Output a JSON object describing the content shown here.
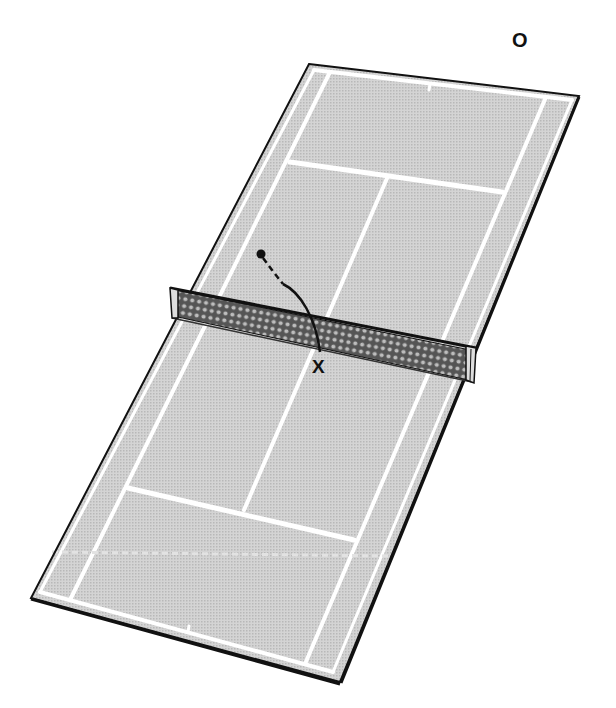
{
  "diagram": {
    "colors": {
      "court_surface": "#cfcfcf",
      "court_lines": "#ffffff",
      "border": "#111111",
      "net_mesh": "#222222",
      "trajectory": "#111111"
    },
    "court": {
      "corners": {
        "far_left": [
          309,
          64
        ],
        "far_right": [
          579,
          96
        ],
        "near_right": [
          340,
          682
        ],
        "near_left": [
          31,
          598
        ]
      }
    },
    "net": {
      "left_top": [
        170,
        288
      ],
      "left_bottom": [
        172,
        318
      ],
      "right_top": [
        476,
        347
      ],
      "right_bottom": [
        473,
        382
      ]
    },
    "trajectory": {
      "start": [
        261,
        254
      ],
      "dashed_end": [
        282,
        283
      ],
      "end": [
        320,
        352
      ]
    },
    "labels": {
      "player_o": {
        "text": "O",
        "x": 512,
        "y": 32
      },
      "player_x": {
        "text": "X",
        "x": 312,
        "y": 357
      }
    }
  }
}
